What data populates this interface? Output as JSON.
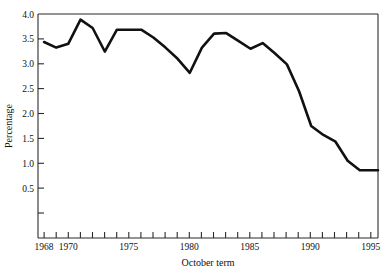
{
  "chart_data": {
    "type": "line",
    "title": "",
    "xlabel": "October term",
    "ylabel": "Percentage",
    "grid": false,
    "legend": "none",
    "xlim": [
      1967.5,
      1995.5
    ],
    "ylim": [
      0.0,
      4.0
    ],
    "yticks": [
      0.5,
      1.0,
      1.5,
      2.0,
      2.5,
      3.0,
      3.5,
      4.0
    ],
    "ytick_labels": [
      "0.5",
      "1.0",
      "1.5",
      "2.0",
      "2.5",
      "3.0",
      "3.5",
      "4.0"
    ],
    "xticks": [
      1968,
      1969,
      1970,
      1971,
      1972,
      1973,
      1974,
      1975,
      1976,
      1977,
      1978,
      1979,
      1980,
      1981,
      1982,
      1983,
      1984,
      1985,
      1986,
      1987,
      1988,
      1989,
      1990,
      1991,
      1992,
      1993,
      1994,
      1995
    ],
    "xtick_labels": [
      "1968",
      "1970",
      "1975",
      "1980",
      "1985",
      "1990",
      "1995"
    ],
    "xtick_label_years": [
      1968,
      1970,
      1975,
      1980,
      1985,
      1990,
      1995
    ],
    "line_color": "#111111",
    "x": [
      1968,
      1969,
      1970,
      1971,
      1972,
      1973,
      1974,
      1975,
      1976,
      1977,
      1978,
      1979,
      1980,
      1981,
      1982,
      1983,
      1984,
      1985,
      1986,
      1987,
      1988,
      1989,
      1990,
      1991,
      1992,
      1993,
      1994,
      1995
    ],
    "values": [
      3.5,
      3.4,
      3.47,
      3.9,
      3.75,
      3.33,
      3.72,
      3.72,
      3.72,
      3.58,
      3.4,
      3.2,
      2.95,
      3.4,
      3.65,
      3.66,
      3.52,
      3.38,
      3.48,
      3.3,
      3.1,
      2.62,
      2.0,
      1.84,
      1.72,
      1.38,
      1.21,
      1.21
    ],
    "series": [
      {
        "name": "Percentage",
        "values": [
          3.5,
          3.4,
          3.47,
          3.9,
          3.75,
          3.33,
          3.72,
          3.72,
          3.72,
          3.58,
          3.4,
          3.2,
          2.95,
          3.4,
          3.65,
          3.66,
          3.52,
          3.38,
          3.48,
          3.3,
          3.1,
          2.62,
          2.0,
          1.84,
          1.72,
          1.38,
          1.21,
          1.21
        ]
      }
    ]
  },
  "axes": {
    "y_title": "Percentage",
    "x_title": "October term",
    "y_labels": [
      "4.0",
      "3.5",
      "3.0",
      "2.5",
      "2.0",
      "1.5",
      "1.0",
      "0.5"
    ],
    "x_labels": [
      "1968",
      "1970",
      "1975",
      "1980",
      "1985",
      "1990",
      "1995"
    ]
  }
}
